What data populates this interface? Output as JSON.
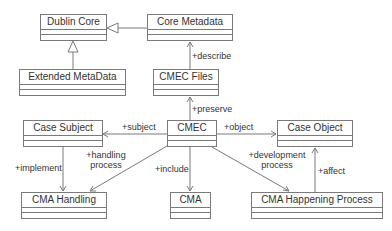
{
  "classes": {
    "dublin_core": "Dublin Core",
    "core_metadata": "Core Metadata",
    "extended_metadata": "Extended MetaData",
    "cmec_files": "CMEC Files",
    "case_subject": "Case Subject",
    "cmec": "CMEC",
    "case_object": "Case Object",
    "cma_handling": "CMA Handling",
    "cma": "CMA",
    "cma_happening_process": "CMA Happening Process"
  },
  "relations": {
    "describe": "+describe",
    "preserve": "+preserve",
    "subject": "+subject",
    "object": "+object",
    "implement": "+implement",
    "handling_process_1": "+handling",
    "handling_process_2": "process",
    "include": "+include",
    "development_process_1": "+development",
    "development_process_2": "process",
    "affect": "+affect"
  },
  "colors": {
    "line": "#7a7a7a",
    "text": "#333333"
  }
}
